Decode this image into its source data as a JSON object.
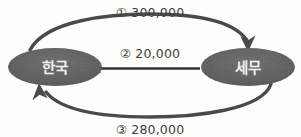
{
  "diagram": {
    "type": "flow-cycle",
    "background_color": "#fdfdfc",
    "node_fill_color": "#585858",
    "node_text_color": "#f2f2f0",
    "edge_color": "#4a4a4a",
    "label_text_color": "#3d3d3d",
    "nodes": [
      {
        "id": "korea",
        "label": "한국",
        "cx": 55,
        "cy": 67,
        "rx": 47,
        "ry": 19
      },
      {
        "id": "tax",
        "label": "세무",
        "cx": 248,
        "cy": 67,
        "rx": 47,
        "ry": 19
      }
    ],
    "edges": [
      {
        "id": "edge-1",
        "marker": "①",
        "amount": "300,000",
        "label": "① 300,000",
        "from": "korea",
        "to": "tax",
        "shape": "arc-top",
        "direction": "left-to-right",
        "label_x": 150,
        "label_y": 13
      },
      {
        "id": "edge-2",
        "marker": "②",
        "amount": "20,000",
        "label": "② 20,000",
        "from": "tax",
        "to": "korea",
        "shape": "straight",
        "direction": "right-to-left",
        "label_x": 150,
        "label_y": 54
      },
      {
        "id": "edge-3",
        "marker": "③",
        "amount": "280,000",
        "label": "③ 280,000",
        "from": "tax",
        "to": "korea",
        "shape": "arc-bottom",
        "direction": "right-to-left",
        "label_x": 150,
        "label_y": 130
      }
    ]
  }
}
